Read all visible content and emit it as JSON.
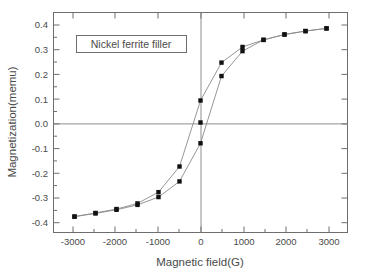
{
  "figure": {
    "background_color": "#ffffff",
    "frame_color": "#6e6e6e",
    "series_color": "#111111",
    "line_color": "#8a8a8a"
  },
  "annotation": {
    "label": "Nickel ferrite filler"
  },
  "axes": {
    "x_title": "Magnetic field(G)",
    "y_title": "Magnetization(memu)",
    "x_ticklabels": [
      "-3000",
      "-2000",
      "-1000",
      "0",
      "1000",
      "2000",
      "3000"
    ],
    "y_ticklabels": [
      "0.4",
      "0.3",
      "0.2",
      "0.1",
      "0.0",
      "-0.1",
      "-0.2",
      "-0.3",
      "-0.4"
    ]
  },
  "chart_data": {
    "type": "line",
    "title": "",
    "annotations": [
      "Nickel ferrite filler"
    ],
    "xlabel": "Magnetic field(G)",
    "ylabel": "Magnetization(memu)",
    "xlim": [
      -3500,
      3500
    ],
    "ylim": [
      -0.45,
      0.45
    ],
    "xticks": [
      -3000,
      -2000,
      -1000,
      0,
      1000,
      2000,
      3000
    ],
    "yticks": [
      0.4,
      0.3,
      0.2,
      0.1,
      0.0,
      -0.1,
      -0.2,
      -0.3,
      -0.4
    ],
    "xminor_interval": 500,
    "grid": false,
    "legend": false,
    "zero_lines": true,
    "marker": "filled-square",
    "series": [
      {
        "name": "ascending branch",
        "x": [
          -3000,
          -2500,
          -2000,
          -1500,
          -1000,
          -500,
          0,
          500,
          1000,
          1500,
          2000,
          2500,
          3000
        ],
        "values": [
          -0.385,
          -0.372,
          -0.357,
          -0.337,
          -0.305,
          -0.241,
          -0.085,
          0.19,
          0.292,
          0.338,
          0.36,
          0.374,
          0.385
        ]
      },
      {
        "name": "descending branch",
        "x": [
          3000,
          2500,
          2000,
          1500,
          1000,
          500,
          0,
          -500,
          -1000,
          -1500,
          -2000,
          -2500,
          -3000
        ],
        "values": [
          0.385,
          0.374,
          0.36,
          0.338,
          0.309,
          0.245,
          0.09,
          -0.18,
          -0.285,
          -0.331,
          -0.354,
          -0.37,
          -0.385
        ]
      },
      {
        "name": "virgin/origin point",
        "x": [
          0
        ],
        "values": [
          0.0
        ]
      }
    ]
  }
}
